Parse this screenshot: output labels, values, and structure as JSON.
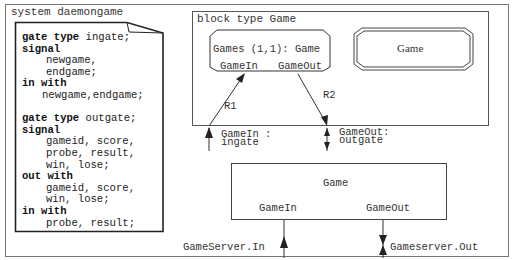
{
  "system": {
    "title": "system daemongame"
  },
  "note": {
    "lines": [
      {
        "kw": "gate type",
        "text": " ingate;",
        "indent": 0
      },
      {
        "kw": "signal",
        "text": "",
        "indent": 0
      },
      {
        "kw": "",
        "text": "newgame,",
        "indent": 1
      },
      {
        "kw": "",
        "text": "endgame;",
        "indent": 1
      },
      {
        "kw": "in with",
        "text": "",
        "indent": 0
      },
      {
        "kw": "",
        "text": "newgame,endgame;",
        "indent": 2
      },
      {
        "kw": "",
        "text": "",
        "indent": 0
      },
      {
        "kw": "gate type",
        "text": " outgate;",
        "indent": 0
      },
      {
        "kw": "signal",
        "text": "",
        "indent": 0
      },
      {
        "kw": "",
        "text": "gameid, score,",
        "indent": 1
      },
      {
        "kw": "",
        "text": "probe, result,",
        "indent": 1
      },
      {
        "kw": "",
        "text": "win, lose;",
        "indent": 1
      },
      {
        "kw": "out with",
        "text": "",
        "indent": 0
      },
      {
        "kw": "",
        "text": "gameid, score,",
        "indent": 1
      },
      {
        "kw": "",
        "text": "win, lose;",
        "indent": 1
      },
      {
        "kw": "in with",
        "text": "",
        "indent": 0
      },
      {
        "kw": "",
        "text": "probe, result;",
        "indent": 1
      }
    ]
  },
  "block_type": {
    "title": "block type Game",
    "instance": {
      "label": "Games (1,1): Game",
      "gate_in": "GameIn",
      "gate_out": "GameOut"
    },
    "type_ref": {
      "label": "Game"
    },
    "routes": {
      "r1": "R1",
      "r2": "R2"
    },
    "gates": {
      "in_label_1": "GameIn :",
      "in_label_2": "ingate",
      "out_label_1": "GameOut:",
      "out_label_2": "outgate"
    }
  },
  "block_instance": {
    "label": "Game",
    "gate_in": "GameIn",
    "gate_out": "GameOut",
    "external_in": "GameServer.In",
    "external_out": "Gameserver.Out"
  },
  "colors": {
    "line": "#333333",
    "frame": "#666666",
    "background": "#ffffff"
  }
}
